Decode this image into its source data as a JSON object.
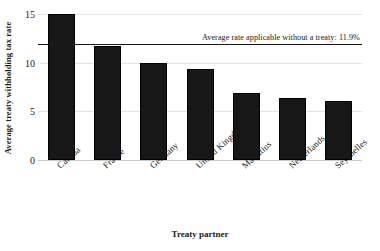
{
  "chart_data": {
    "type": "bar",
    "title": "",
    "xlabel": "Treaty partner",
    "ylabel": "Average treaty withholding tax rate",
    "categories": [
      "Canada",
      "France",
      "Germany",
      "United Kingdom",
      "Mauritius",
      "Netherlands",
      "Seychelles"
    ],
    "values": [
      15.0,
      11.7,
      10.0,
      9.3,
      6.9,
      6.4,
      6.1
    ],
    "ylim": [
      0,
      15
    ],
    "yticks": [
      0,
      5,
      10,
      15
    ],
    "ytick_labels": [
      "0",
      "5",
      "10",
      "15"
    ],
    "grid": true,
    "legend": "none",
    "annotations": [
      {
        "name": "average-rate-reference",
        "text": "Average rate applicable without a treaty: 11.9%",
        "value": 11.9,
        "type": "horizontal-line"
      }
    ],
    "bar_color": "#171717",
    "gridline_color": "#e4e4e4",
    "reference_line_color": "#1a1a1a"
  }
}
